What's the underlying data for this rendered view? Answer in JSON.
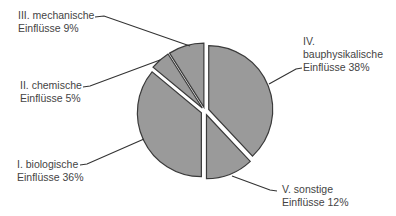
{
  "chart_data": {
    "type": "pie",
    "title": "",
    "start_angle_deg": 0,
    "direction": "clockwise",
    "exploded": true,
    "slices": [
      {
        "id": "IV",
        "line1": "IV.",
        "line2": "bauphysikalische",
        "line3": "Einflüsse 38%",
        "label": "IV. bauphysikalische Einflüsse",
        "value": 38
      },
      {
        "id": "V",
        "line1": "V. sonstige",
        "line2": "Einflüsse 12%",
        "label": "V. sonstige Einflüsse",
        "value": 12
      },
      {
        "id": "I",
        "line1": "I. biologische",
        "line2": "Einflüsse 36%",
        "label": "I. biologische Einflüsse",
        "value": 36
      },
      {
        "id": "II",
        "line1": "II. chemische",
        "line2": "Einflüsse 5%",
        "label": "II. chemische Einflüsse",
        "value": 5
      },
      {
        "id": "III",
        "line1": "III. mechanische",
        "line2": "Einflüsse 9%",
        "label": "III. mechanische Einflüsse",
        "value": 9
      }
    ],
    "colors": {
      "fill": "#9a9a9a",
      "stroke": "#3a3a3a",
      "leader": "#333333",
      "text": "#444444"
    }
  }
}
